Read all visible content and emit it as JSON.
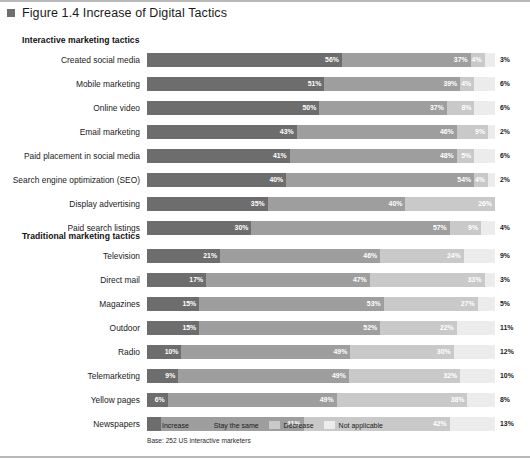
{
  "figure": {
    "marker_icon": "square-bullet-icon",
    "title": "Figure 1.4 Increase of Digital Tactics"
  },
  "sections": [
    {
      "heading": "Interactive marketing tactics"
    },
    {
      "heading": "Traditional marketing tactics"
    }
  ],
  "legend": {
    "items": [
      {
        "label": "Increase",
        "color": "#6d6d6d"
      },
      {
        "label": "Stay the same",
        "color": "#9e9e9e"
      },
      {
        "label": "Decrease",
        "color": "#c9c9c9"
      },
      {
        "label": "Not applicable",
        "color": "#ececec"
      }
    ]
  },
  "base_note": "Base: 252 US interactive marketers",
  "chart_data": {
    "type": "bar",
    "title": "Figure 1.4 Increase of Digital Tactics",
    "subtype": "stacked-horizontal-100-percent",
    "xlabel": "",
    "ylabel": "",
    "xlim": [
      0,
      100
    ],
    "grid": false,
    "legend_position": "bottom",
    "series": [
      {
        "name": "Increase",
        "color": "#6d6d6d"
      },
      {
        "name": "Stay the same",
        "color": "#9e9e9e"
      },
      {
        "name": "Decrease",
        "color": "#c9c9c9"
      },
      {
        "name": "Not applicable",
        "color": "#ececec"
      }
    ],
    "groups": [
      {
        "heading": "Interactive marketing tactics",
        "categories": [
          "Created social media",
          "Mobile marketing",
          "Online video",
          "Email marketing",
          "Paid placement in social media",
          "Search engine optimization (SEO)",
          "Display advertising",
          "Paid search listings"
        ],
        "rows": [
          {
            "label": "Created social media",
            "segments": [
              {
                "series": "Increase",
                "value": 56,
                "value_label": "56%",
                "label_inside": true
              },
              {
                "series": "Stay the same",
                "value": 37,
                "value_label": "37%",
                "label_inside": true
              },
              {
                "series": "Decrease",
                "value": 4,
                "value_label": "4%",
                "label_inside": true
              },
              {
                "series": "Not applicable",
                "value": 3,
                "value_label": "3%",
                "label_inside": false
              }
            ]
          },
          {
            "label": "Mobile marketing",
            "segments": [
              {
                "series": "Increase",
                "value": 51,
                "value_label": "51%",
                "label_inside": true
              },
              {
                "series": "Stay the same",
                "value": 39,
                "value_label": "39%",
                "label_inside": true
              },
              {
                "series": "Decrease",
                "value": 4,
                "value_label": "4%",
                "label_inside": true
              },
              {
                "series": "Not applicable",
                "value": 6,
                "value_label": "6%",
                "label_inside": false
              }
            ]
          },
          {
            "label": "Online video",
            "segments": [
              {
                "series": "Increase",
                "value": 50,
                "value_label": "50%",
                "label_inside": true
              },
              {
                "series": "Stay the same",
                "value": 37,
                "value_label": "37%",
                "label_inside": true
              },
              {
                "series": "Decrease",
                "value": 8,
                "value_label": "8%",
                "label_inside": true
              },
              {
                "series": "Not applicable",
                "value": 6,
                "value_label": "6%",
                "label_inside": false
              }
            ]
          },
          {
            "label": "Email marketing",
            "segments": [
              {
                "series": "Increase",
                "value": 43,
                "value_label": "43%",
                "label_inside": true
              },
              {
                "series": "Stay the same",
                "value": 46,
                "value_label": "46%",
                "label_inside": true
              },
              {
                "series": "Decrease",
                "value": 9,
                "value_label": "9%",
                "label_inside": true
              },
              {
                "series": "Not applicable",
                "value": 2,
                "value_label": "2%",
                "label_inside": false
              }
            ]
          },
          {
            "label": "Paid placement in social media",
            "segments": [
              {
                "series": "Increase",
                "value": 41,
                "value_label": "41%",
                "label_inside": true
              },
              {
                "series": "Stay the same",
                "value": 48,
                "value_label": "48%",
                "label_inside": true
              },
              {
                "series": "Decrease",
                "value": 5,
                "value_label": "5%",
                "label_inside": true
              },
              {
                "series": "Not applicable",
                "value": 6,
                "value_label": "6%",
                "label_inside": false
              }
            ]
          },
          {
            "label": "Search engine optimization (SEO)",
            "segments": [
              {
                "series": "Increase",
                "value": 40,
                "value_label": "40%",
                "label_inside": true
              },
              {
                "series": "Stay the same",
                "value": 54,
                "value_label": "54%",
                "label_inside": true
              },
              {
                "series": "Decrease",
                "value": 4,
                "value_label": "4%",
                "label_inside": true
              },
              {
                "series": "Not applicable",
                "value": 2,
                "value_label": "2%",
                "label_inside": false
              }
            ]
          },
          {
            "label": "Display advertising",
            "segments": [
              {
                "series": "Increase",
                "value": 35,
                "value_label": "35%",
                "label_inside": true
              },
              {
                "series": "Stay the same",
                "value": 40,
                "value_label": "40%",
                "label_inside": true
              },
              {
                "series": "Decrease",
                "value": 26,
                "value_label": "26%",
                "label_inside": true
              }
            ]
          },
          {
            "label": "Paid search listings",
            "segments": [
              {
                "series": "Increase",
                "value": 30,
                "value_label": "30%",
                "label_inside": true
              },
              {
                "series": "Stay the same",
                "value": 57,
                "value_label": "57%",
                "label_inside": true
              },
              {
                "series": "Decrease",
                "value": 9,
                "value_label": "9%",
                "label_inside": true
              },
              {
                "series": "Not applicable",
                "value": 4,
                "value_label": "4%",
                "label_inside": false
              }
            ]
          }
        ]
      },
      {
        "heading": "Traditional marketing tactics",
        "categories": [
          "Television",
          "Direct mail",
          "Magazines",
          "Outdoor",
          "Radio",
          "Telemarketing",
          "Yellow pages",
          "Newspapers"
        ],
        "rows": [
          {
            "label": "Television",
            "segments": [
              {
                "series": "Increase",
                "value": 21,
                "value_label": "21%",
                "label_inside": true
              },
              {
                "series": "Stay the same",
                "value": 46,
                "value_label": "46%",
                "label_inside": true
              },
              {
                "series": "Decrease",
                "value": 24,
                "value_label": "24%",
                "label_inside": true
              },
              {
                "series": "Not applicable",
                "value": 9,
                "value_label": "9%",
                "label_inside": false
              }
            ]
          },
          {
            "label": "Direct mail",
            "segments": [
              {
                "series": "Increase",
                "value": 17,
                "value_label": "17%",
                "label_inside": true
              },
              {
                "series": "Stay the same",
                "value": 47,
                "value_label": "47%",
                "label_inside": true
              },
              {
                "series": "Decrease",
                "value": 33,
                "value_label": "33%",
                "label_inside": true
              },
              {
                "series": "Not applicable",
                "value": 3,
                "value_label": "3%",
                "label_inside": false
              }
            ]
          },
          {
            "label": "Magazines",
            "segments": [
              {
                "series": "Increase",
                "value": 15,
                "value_label": "15%",
                "label_inside": true
              },
              {
                "series": "Stay the same",
                "value": 53,
                "value_label": "53%",
                "label_inside": true
              },
              {
                "series": "Decrease",
                "value": 27,
                "value_label": "27%",
                "label_inside": true
              },
              {
                "series": "Not applicable",
                "value": 5,
                "value_label": "5%",
                "label_inside": false
              }
            ]
          },
          {
            "label": "Outdoor",
            "segments": [
              {
                "series": "Increase",
                "value": 15,
                "value_label": "15%",
                "label_inside": true
              },
              {
                "series": "Stay the same",
                "value": 52,
                "value_label": "52%",
                "label_inside": true
              },
              {
                "series": "Decrease",
                "value": 22,
                "value_label": "22%",
                "label_inside": true
              },
              {
                "series": "Not applicable",
                "value": 11,
                "value_label": "11%",
                "label_inside": false
              }
            ]
          },
          {
            "label": "Radio",
            "segments": [
              {
                "series": "Increase",
                "value": 10,
                "value_label": "10%",
                "label_inside": true
              },
              {
                "series": "Stay the same",
                "value": 49,
                "value_label": "49%",
                "label_inside": true
              },
              {
                "series": "Decrease",
                "value": 30,
                "value_label": "30%",
                "label_inside": true
              },
              {
                "series": "Not applicable",
                "value": 12,
                "value_label": "12%",
                "label_inside": false
              }
            ]
          },
          {
            "label": "Telemarketing",
            "segments": [
              {
                "series": "Increase",
                "value": 9,
                "value_label": "9%",
                "label_inside": true
              },
              {
                "series": "Stay the same",
                "value": 49,
                "value_label": "49%",
                "label_inside": true
              },
              {
                "series": "Decrease",
                "value": 32,
                "value_label": "32%",
                "label_inside": true
              },
              {
                "series": "Not applicable",
                "value": 10,
                "value_label": "10%",
                "label_inside": false
              }
            ]
          },
          {
            "label": "Yellow pages",
            "segments": [
              {
                "series": "Increase",
                "value": 6,
                "value_label": "6%",
                "label_inside": true
              },
              {
                "series": "Stay the same",
                "value": 49,
                "value_label": "49%",
                "label_inside": true
              },
              {
                "series": "Decrease",
                "value": 38,
                "value_label": "38%",
                "label_inside": true
              },
              {
                "series": "Not applicable",
                "value": 8,
                "value_label": "8%",
                "label_inside": false
              }
            ]
          },
          {
            "label": "Newspapers",
            "segments": [
              {
                "series": "Increase",
                "value": 4,
                "value_label": "4%",
                "label_inside": true
              },
              {
                "series": "Stay the same",
                "value": 41,
                "value_label": "41%",
                "label_inside": true
              },
              {
                "series": "Decrease",
                "value": 42,
                "value_label": "42%",
                "label_inside": true
              },
              {
                "series": "Not applicable",
                "value": 13,
                "value_label": "13%",
                "label_inside": false
              }
            ]
          }
        ]
      }
    ]
  }
}
